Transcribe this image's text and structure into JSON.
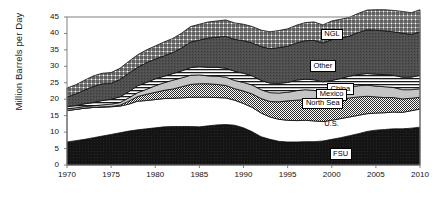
{
  "chart_data": {
    "type": "area",
    "title": "",
    "xlabel": "",
    "ylabel": "Million Barrels per Day",
    "xlim": [
      1970,
      2010
    ],
    "ylim": [
      0,
      45
    ],
    "ytick_labels": [
      "0",
      "5",
      "10",
      "15",
      "20",
      "25",
      "30",
      "35",
      "40",
      "45"
    ],
    "yticks": [
      0,
      5,
      10,
      15,
      20,
      25,
      30,
      35,
      40,
      45
    ],
    "xtick_labels": [
      "1970",
      "1975",
      "1980",
      "1985",
      "1990",
      "1995",
      "2000",
      "2005",
      "2010"
    ],
    "xticks": [
      1970,
      1975,
      1980,
      1985,
      1990,
      1995,
      2000,
      2005,
      2010
    ],
    "grid": false,
    "legend_position": "inline-annotations",
    "stacked": true,
    "x": [
      1970,
      1971,
      1972,
      1973,
      1974,
      1975,
      1976,
      1977,
      1978,
      1979,
      1980,
      1981,
      1982,
      1983,
      1984,
      1985,
      1986,
      1987,
      1988,
      1989,
      1990,
      1991,
      1992,
      1993,
      1994,
      1995,
      1996,
      1997,
      1998,
      1999,
      2000,
      2001,
      2002,
      2003,
      2004,
      2005,
      2006,
      2007,
      2008,
      2009,
      2010
    ],
    "series": [
      {
        "name": "FSU",
        "pattern": "solid-black",
        "values": [
          7.0,
          7.4,
          7.8,
          8.3,
          8.8,
          9.3,
          9.8,
          10.3,
          10.7,
          11.0,
          11.3,
          11.6,
          11.7,
          11.7,
          11.7,
          11.6,
          11.9,
          12.2,
          12.3,
          12.1,
          11.3,
          10.1,
          8.6,
          7.8,
          7.2,
          7.0,
          7.0,
          7.1,
          7.1,
          7.3,
          7.8,
          8.3,
          8.9,
          9.5,
          10.2,
          10.6,
          10.8,
          11.0,
          11.0,
          11.2,
          11.5
        ]
      },
      {
        "name": "U.S.",
        "pattern": "white",
        "values": [
          9.6,
          9.5,
          9.5,
          9.2,
          8.8,
          8.4,
          8.1,
          8.2,
          8.7,
          8.6,
          8.6,
          8.6,
          8.6,
          8.7,
          8.9,
          9.0,
          8.7,
          8.3,
          8.1,
          7.6,
          7.4,
          7.4,
          7.2,
          6.8,
          6.7,
          6.6,
          6.5,
          6.5,
          6.3,
          5.9,
          5.8,
          5.8,
          5.7,
          5.6,
          5.4,
          5.2,
          5.1,
          5.1,
          5.0,
          5.3,
          5.5
        ]
      },
      {
        "name": "North Sea",
        "pattern": "fine-checker",
        "values": [
          0.0,
          0.0,
          0.0,
          0.0,
          0.1,
          0.1,
          0.3,
          0.9,
          1.4,
          1.9,
          2.2,
          2.5,
          2.8,
          3.4,
          3.9,
          4.1,
          4.1,
          4.0,
          3.8,
          3.5,
          3.8,
          4.1,
          4.4,
          4.7,
          5.3,
          5.9,
          6.2,
          6.3,
          6.2,
          6.0,
          5.9,
          5.8,
          5.8,
          5.6,
          5.3,
          4.9,
          4.6,
          4.4,
          4.1,
          3.8,
          3.6
        ]
      },
      {
        "name": "Mexico",
        "pattern": "light-gray",
        "values": [
          0.5,
          0.5,
          0.5,
          0.5,
          0.6,
          0.7,
          0.8,
          1.0,
          1.2,
          1.5,
          2.0,
          2.3,
          2.7,
          2.7,
          2.8,
          2.7,
          2.4,
          2.5,
          2.5,
          2.5,
          2.6,
          2.7,
          2.7,
          2.7,
          2.7,
          2.6,
          2.9,
          3.0,
          3.1,
          2.9,
          3.0,
          3.1,
          3.2,
          3.4,
          3.4,
          3.3,
          3.3,
          3.1,
          2.8,
          2.6,
          2.6
        ]
      },
      {
        "name": "China",
        "pattern": "horizontal-lines",
        "values": [
          0.6,
          0.7,
          0.8,
          1.0,
          1.3,
          1.5,
          1.7,
          1.9,
          2.1,
          2.1,
          2.1,
          2.0,
          2.0,
          2.1,
          2.3,
          2.5,
          2.6,
          2.7,
          2.7,
          2.8,
          2.8,
          2.8,
          2.8,
          2.9,
          2.9,
          3.0,
          3.2,
          3.2,
          3.2,
          3.2,
          3.2,
          3.3,
          3.4,
          3.4,
          3.5,
          3.6,
          3.7,
          3.7,
          3.8,
          3.8,
          4.1
        ]
      },
      {
        "name": "Other",
        "pattern": "dark-gray",
        "values": [
          3.0,
          3.5,
          4.2,
          4.9,
          5.1,
          4.8,
          5.3,
          5.6,
          5.6,
          6.0,
          6.0,
          6.2,
          6.4,
          7.0,
          7.8,
          8.1,
          8.9,
          9.2,
          9.7,
          9.7,
          9.9,
          10.0,
          10.3,
          10.5,
          10.9,
          11.0,
          11.3,
          11.7,
          12.0,
          11.8,
          12.4,
          12.3,
          12.2,
          12.8,
          13.3,
          13.4,
          13.3,
          13.2,
          13.4,
          13.0,
          13.2
        ]
      },
      {
        "name": "NGL",
        "pattern": "crosshatch",
        "values": [
          2.7,
          2.8,
          3.0,
          3.2,
          3.2,
          3.3,
          3.4,
          3.6,
          3.8,
          3.9,
          4.0,
          4.2,
          4.3,
          4.5,
          4.7,
          4.8,
          4.9,
          4.9,
          5.0,
          5.0,
          5.0,
          5.0,
          5.0,
          5.1,
          5.2,
          5.3,
          5.4,
          5.5,
          5.6,
          5.5,
          5.7,
          5.7,
          5.7,
          5.8,
          6.0,
          6.2,
          6.4,
          6.5,
          6.6,
          6.6,
          6.7
        ]
      }
    ],
    "annotations": [
      {
        "label": "NGL",
        "x": 2000,
        "y": 39.6
      },
      {
        "label": "Other",
        "x": 1999,
        "y": 30.0
      },
      {
        "label": "China",
        "x": 2001,
        "y": 23.1
      },
      {
        "label": "Mexico",
        "x": 2000,
        "y": 21.3
      },
      {
        "label": "North Sea",
        "x": 1999,
        "y": 18.6
      },
      {
        "label": "U.S.",
        "x": 2000,
        "y": 12.4
      },
      {
        "label": "FSU",
        "x": 2001,
        "y": 3.2
      }
    ]
  },
  "colors": {
    "fsu": "#111111",
    "us": "#ffffff",
    "north_sea": "#8a8a8a",
    "mexico": "#c8c8c8",
    "china": "#ffffff",
    "other": "#4a4a4a",
    "ngl": "#ffffff",
    "axis": "#808080",
    "text": "#111111"
  }
}
